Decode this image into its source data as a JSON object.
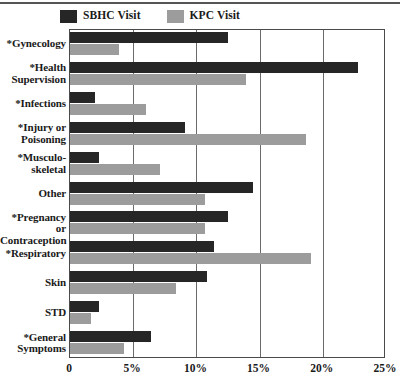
{
  "chart_data": {
    "type": "bar",
    "orientation": "horizontal",
    "title": "",
    "xlabel": "",
    "ylabel": "",
    "xlim": [
      0,
      25
    ],
    "xtick_labels": [
      "0",
      "5%",
      "10%",
      "15%",
      "20%",
      "25%"
    ],
    "xtick_values": [
      0,
      5,
      10,
      15,
      20,
      25
    ],
    "grid": true,
    "legend_position": "top-left",
    "categories": [
      "*Gynecology",
      "*Health Supervision",
      "*Infections",
      "*Injury or Poisoning",
      "*Musculo-skeletal",
      "Other",
      "*Pregnancy or Contraception",
      "*Respiratory",
      "Skin",
      "STD",
      "*General Symptoms"
    ],
    "category_lines": [
      [
        "*Gynecology"
      ],
      [
        "*Health",
        "Supervision"
      ],
      [
        "*Infections"
      ],
      [
        "*Injury or",
        "Poisoning"
      ],
      [
        "*Musculo-",
        "skeletal"
      ],
      [
        "Other"
      ],
      [
        "*Pregnancy or",
        "Contraception"
      ],
      [
        "*Respiratory"
      ],
      [
        "Skin"
      ],
      [
        "STD"
      ],
      [
        "*General",
        "Symptoms"
      ]
    ],
    "series": [
      {
        "name": "SBHC Visit",
        "color": "#262626",
        "values": [
          12.5,
          22.8,
          2.0,
          9.1,
          2.3,
          14.5,
          12.5,
          11.4,
          10.8,
          2.3,
          6.4
        ]
      },
      {
        "name": "KPC Visit",
        "color": "#9c9c9c",
        "values": [
          3.9,
          13.9,
          6.0,
          18.7,
          7.1,
          10.7,
          10.7,
          19.1,
          8.4,
          1.7,
          4.3
        ]
      }
    ]
  },
  "legend": {
    "items": [
      {
        "label": "SBHC Visit",
        "swatch": "sbhc"
      },
      {
        "label": "KPC Visit",
        "swatch": "kpc"
      }
    ]
  },
  "colors": {
    "sbhc": "#262626",
    "kpc": "#9c9c9c",
    "axis": "#4a4a4a",
    "grid": "#6b6b6b"
  }
}
